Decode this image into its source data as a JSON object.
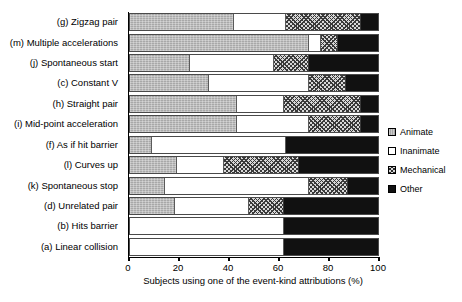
{
  "chart_data": {
    "type": "bar",
    "orientation": "horizontal",
    "stacked": true,
    "title": "",
    "xlabel": "Subjects using one of the event-kind attributions (%)",
    "ylabel": "",
    "xlim": [
      0,
      100
    ],
    "xticks": [
      0,
      20,
      40,
      60,
      80,
      100
    ],
    "xtick_labels": [
      "0",
      "20",
      "40",
      "60",
      "80",
      "100"
    ],
    "grid": false,
    "legend_position": "right",
    "categories": [
      "(g) Zigzag pair",
      "(m) Multiple accelerations",
      "(j) Spontaneous start",
      "(c) Constant V",
      "(h) Straight pair",
      "(i) Mid-point acceleration",
      "(f) As if hit barrier",
      "(l) Curves up",
      "(k) Spontaneous stop",
      "(d) Unrelated pair",
      "(b) Hits barrier",
      "(a) Linear collision"
    ],
    "series": [
      {
        "name": "Animate",
        "key": "animate",
        "values": [
          42,
          72,
          24,
          32,
          43,
          43,
          9,
          19,
          14,
          18,
          0,
          0
        ]
      },
      {
        "name": "Inanimate",
        "key": "inanimate",
        "values": [
          21,
          5,
          34,
          40,
          19,
          29,
          54,
          19,
          58,
          30,
          62,
          62
        ]
      },
      {
        "name": "Mechanical",
        "key": "mechanical",
        "values": [
          30,
          7,
          14,
          15,
          31,
          21,
          0,
          30,
          16,
          14,
          0,
          0
        ]
      },
      {
        "name": "Other",
        "key": "other",
        "values": [
          7,
          16,
          28,
          13,
          7,
          7,
          37,
          32,
          12,
          38,
          38,
          38
        ]
      }
    ],
    "legend_entries": [
      {
        "label": "Animate",
        "key": "animate",
        "color": "#a8a8a8"
      },
      {
        "label": "Inanimate",
        "key": "inanimate",
        "color": "#ffffff"
      },
      {
        "label": "Mechanical",
        "key": "mechanical",
        "color": "#d8d8d8"
      },
      {
        "label": "Other",
        "key": "other",
        "color": "#111111"
      }
    ]
  }
}
